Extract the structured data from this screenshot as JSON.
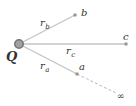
{
  "diagram": {
    "charge": {
      "label": "Q",
      "x": 19,
      "y": 44
    },
    "points": [
      {
        "id": "b",
        "label": "b",
        "x": 75,
        "y": 15,
        "distance_label": "r",
        "distance_sub": "b"
      },
      {
        "id": "c",
        "label": "c",
        "x": 126,
        "y": 44,
        "distance_label": "r",
        "distance_sub": "c"
      },
      {
        "id": "a",
        "label": "a",
        "x": 77,
        "y": 74,
        "distance_label": "r",
        "distance_sub": "a"
      }
    ],
    "infinity": {
      "label": "∞",
      "x": 122,
      "y": 96
    },
    "colors": {
      "line": "#bbbbbb",
      "point": "#999999",
      "charge": "#888888",
      "text": "#333333"
    }
  }
}
